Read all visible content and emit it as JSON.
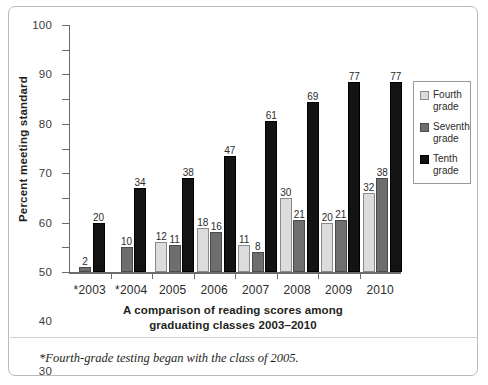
{
  "chart_data": {
    "type": "bar",
    "title": "A comparison of reading scores among graduating classes 2003–2010",
    "xlabel": "",
    "ylabel": "Percent meeting standard",
    "ylim": [
      0,
      100
    ],
    "ytick_step": 10,
    "grid": false,
    "legend_position": "right",
    "categories": [
      "*2003",
      "*2004",
      "2005",
      "2006",
      "2007",
      "2008",
      "2009",
      "2010"
    ],
    "yticks": [
      "100",
      "90",
      "80",
      "70",
      "60",
      "50",
      "40",
      "30",
      "20",
      "10",
      "0"
    ],
    "series": [
      {
        "name": "Fourth grade",
        "color": "#dcdcdc",
        "values": [
          null,
          null,
          12,
          18,
          11,
          30,
          20,
          32
        ]
      },
      {
        "name": "Seventh grade",
        "color": "#6e6e6e",
        "values": [
          2,
          10,
          11,
          16,
          8,
          21,
          21,
          38
        ]
      },
      {
        "name": "Tenth grade",
        "color": "#131313",
        "values": [
          20,
          34,
          38,
          47,
          61,
          69,
          77,
          77
        ]
      }
    ],
    "annotations": [
      "*Fourth-grade testing began with the class of 2005."
    ]
  },
  "figure": {
    "y_axis_title": "Percent meeting standard",
    "caption_line1": "A comparison of reading scores among",
    "caption_line2": "graduating classes 2003–2010",
    "footnote": "*Fourth-grade testing began with the class of 2005."
  },
  "legend": {
    "items": [
      {
        "label_line1": "Fourth",
        "label_line2": "grade"
      },
      {
        "label_line1": "Seventh",
        "label_line2": "grade"
      },
      {
        "label_line1": "Tenth",
        "label_line2": "grade"
      }
    ]
  }
}
